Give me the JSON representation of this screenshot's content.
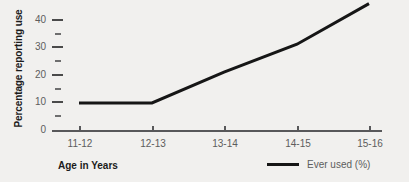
{
  "chart_data": {
    "type": "line",
    "title": "",
    "xlabel": "Age in Years",
    "ylabel": "Percentage reporting use",
    "categories": [
      "11-12",
      "12-13",
      "13-14",
      "14-15",
      "15-16"
    ],
    "series": [
      {
        "name": "Ever used (%)",
        "values": [
          10,
          10,
          21,
          31,
          45.5
        ],
        "color": "#161616"
      }
    ],
    "ylim": [
      0,
      45
    ],
    "yticks": [
      0,
      10,
      20,
      30,
      40
    ],
    "ytick_labels": [
      "0",
      "10",
      "20",
      "30",
      "40"
    ],
    "yminor_ticks": [
      5,
      15,
      25,
      35,
      45
    ],
    "grid": false,
    "legend_position": "bottom-right"
  },
  "legend": {
    "entries": [
      {
        "label": "Ever used (%)",
        "color": "#161616"
      }
    ]
  },
  "axes": {
    "x_title": "Age in Years",
    "y_title": "Percentage reporting use"
  },
  "colors": {
    "background": "#f1f0ee",
    "line": "#161616",
    "axis": "#58585a",
    "tick_text": "#5d5d5d",
    "title_text": "#1b1b1b"
  }
}
